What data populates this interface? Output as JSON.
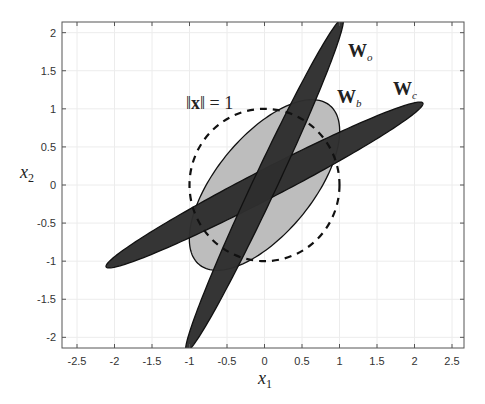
{
  "chart_data": {
    "type": "scatter",
    "title": "",
    "xlabel": "x_1",
    "ylabel": "x_2",
    "xlim": [
      -2.7,
      2.66
    ],
    "ylim": [
      -2.14,
      2.14
    ],
    "grid": true,
    "x_ticks": [
      -2.5,
      -2,
      -1.5,
      -1,
      -0.5,
      0,
      0.5,
      1,
      1.5,
      2,
      2.5
    ],
    "x_tick_labels": [
      "-2.5",
      "-2",
      "-1.5",
      "-1",
      "-0.5",
      "0",
      "0.5",
      "1",
      "1.5",
      "2",
      "2.5"
    ],
    "y_ticks": [
      2,
      1.5,
      1,
      0.5,
      0,
      -0.5,
      -1,
      -1.5,
      -2
    ],
    "y_tick_labels": [
      "2",
      "1.5",
      "1",
      "0.5",
      "0",
      "-0.5",
      "-1",
      "-1.5",
      "-2"
    ],
    "shapes": [
      {
        "name": "W_b",
        "kind": "ellipse",
        "center": [
          0,
          0
        ],
        "semi_major": 1.36,
        "semi_minor": 0.64,
        "angle_deg": 50,
        "fill": "#bdbdbd",
        "stroke": "#111111"
      },
      {
        "name": "W_c",
        "kind": "ellipse",
        "center": [
          0,
          0
        ],
        "semi_major": 2.37,
        "semi_minor": 0.19,
        "angle_deg": 27,
        "fill": "#2e2e2e",
        "stroke": "#111111"
      },
      {
        "name": "W_o",
        "kind": "ellipse",
        "center": [
          0,
          0
        ],
        "semi_major": 2.42,
        "semi_minor": 0.16,
        "angle_deg": 64.5,
        "fill": "#2e2e2e",
        "stroke": "#111111"
      },
      {
        "name": "unit_circle",
        "kind": "circle",
        "center": [
          0,
          0
        ],
        "radius": 1,
        "style": "dashed",
        "stroke": "#111111"
      }
    ],
    "annotations": [
      {
        "text": "W_o",
        "x": 1.45,
        "y": 1.7
      },
      {
        "text": "W_b",
        "x": 0.75,
        "y": 1.18
      },
      {
        "text": "W_c",
        "x": 1.85,
        "y": 1.25
      },
      {
        "text": "||x|| = 1",
        "x": -0.75,
        "y": 1.15
      }
    ]
  },
  "labels": {
    "xlabel_main": "x",
    "xlabel_sub": "1",
    "ylabel_main": "x",
    "ylabel_sub": "2",
    "wo_main": "W",
    "wo_sub": "o",
    "wb_main": "W",
    "wb_sub": "b",
    "wc_main": "W",
    "wc_sub": "c",
    "norm_left": "‖",
    "norm_x": "x",
    "norm_right": "‖ = 1"
  }
}
